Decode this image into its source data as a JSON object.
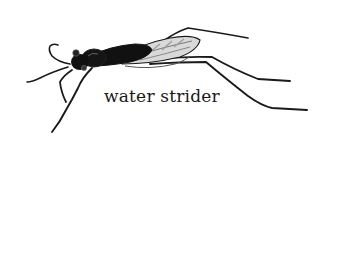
{
  "illustration": {
    "subject": "water strider",
    "style": "black-and-white ink illustration",
    "colors": {
      "background": "#ffffff",
      "ink": "#1a1a1a",
      "body": "#111111",
      "wing": "#8a8a8a"
    }
  },
  "caption": {
    "text": "water strider"
  }
}
